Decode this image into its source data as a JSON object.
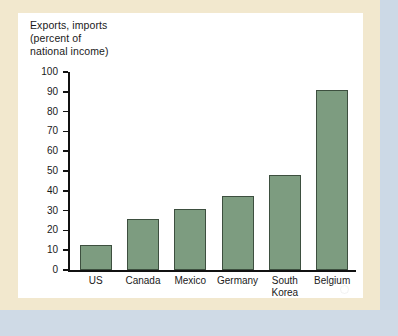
{
  "figure": {
    "panel_background": "#ffffff",
    "frame_color": "#f2e8ce",
    "edge_color": "#ccd9e6"
  },
  "axis_title": "Exports, imports\n(percent of\nnational income)",
  "y_ticks": [
    "100",
    "90",
    "80",
    "70",
    "60",
    "50",
    "40",
    "30",
    "20",
    "10",
    "0"
  ],
  "categories": [
    {
      "label": "US"
    },
    {
      "label": "Canada"
    },
    {
      "label": "Mexico"
    },
    {
      "label": "Germany"
    },
    {
      "label": "South\nKorea"
    },
    {
      "label": "Belgium"
    }
  ],
  "chart_data": {
    "type": "bar",
    "title": "",
    "subtitle": "",
    "xlabel": "",
    "ylabel": "Exports, imports (percent of national income)",
    "categories": [
      "US",
      "Canada",
      "Mexico",
      "Germany",
      "South Korea",
      "Belgium"
    ],
    "values": [
      12.5,
      26,
      31,
      37.5,
      48,
      91
    ],
    "ylim": [
      0,
      100
    ],
    "ytick_step": 10,
    "yticks": [
      0,
      10,
      20,
      30,
      40,
      50,
      60,
      70,
      80,
      90,
      100
    ],
    "grid": false,
    "legend": "none",
    "bar_color": "#7d9c80",
    "bar_edge_color": "#3d4f3f"
  }
}
